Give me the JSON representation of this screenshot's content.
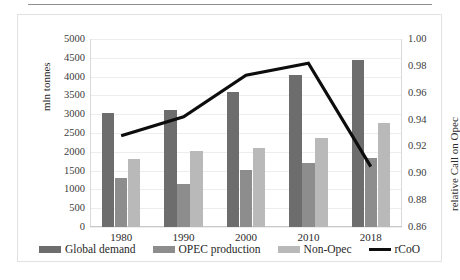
{
  "chart_data": {
    "type": "bar",
    "title": "",
    "xlabel": "",
    "ylabel": "mln tonnes",
    "y2label": "relative Call on Opec",
    "categories": [
      "1980",
      "1990",
      "2000",
      "2010",
      "2018"
    ],
    "ylim": [
      0,
      5000
    ],
    "yticks": [
      "0",
      "500",
      "1000",
      "1500",
      "2000",
      "2500",
      "3000",
      "3500",
      "4000",
      "4500",
      "5000"
    ],
    "y2lim": [
      0.86,
      1.0
    ],
    "y2ticks": [
      "0.86",
      "0.88",
      "0.90",
      "0.92",
      "0.94",
      "0.96",
      "0.98",
      "1.00"
    ],
    "grid": true,
    "legend_position": "bottom",
    "series": [
      {
        "name": "Global demand",
        "axis": "left",
        "kind": "bar",
        "color": "#6d6d6d",
        "values": [
          3020,
          3120,
          3600,
          4050,
          4440
        ]
      },
      {
        "name": "OPEC production",
        "axis": "left",
        "kind": "bar",
        "color": "#8d8d8d",
        "values": [
          1300,
          1140,
          1520,
          1690,
          1840
        ]
      },
      {
        "name": "Non-Opec",
        "axis": "left",
        "kind": "bar",
        "color": "#b9b9b9",
        "values": [
          1810,
          2030,
          2100,
          2370,
          2770
        ]
      },
      {
        "name": "rCoO",
        "axis": "right",
        "kind": "line",
        "color": "#0d0d0d",
        "values": [
          0.928,
          0.942,
          0.973,
          0.982,
          0.905
        ]
      }
    ]
  },
  "legend": {
    "items": [
      {
        "label": "Global demand",
        "color": "#6d6d6d",
        "kind": "bar"
      },
      {
        "label": "OPEC production",
        "color": "#8d8d8d",
        "kind": "bar"
      },
      {
        "label": "Non-Opec",
        "color": "#b9b9b9",
        "kind": "bar"
      },
      {
        "label": "rCoO",
        "color": "#0d0d0d",
        "kind": "line"
      }
    ]
  }
}
